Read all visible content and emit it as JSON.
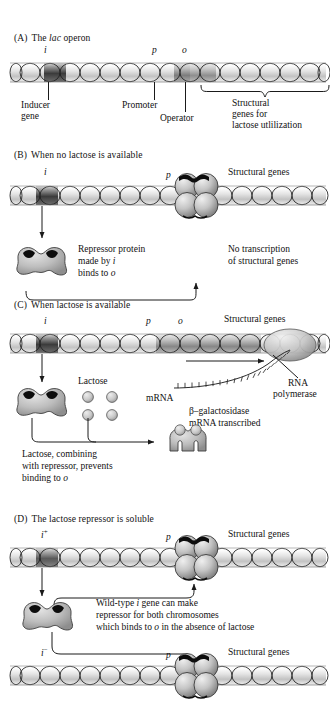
{
  "figure": {
    "background": "#ffffff",
    "ink": "#111111",
    "dna_light": "#f2f2f2",
    "dna_mid": "#b8b8b8",
    "dna_dark": "#4a4a4a",
    "protein_fill": "#b9b9b9",
    "notch_fill": "#101010"
  },
  "panels": [
    {
      "id": "A",
      "tag": "(A)",
      "title_plain_1": "The ",
      "title_italic": "lac",
      "title_plain_2": " operon",
      "gene_labels": [
        {
          "name": "i-gene-label",
          "text": "i"
        },
        {
          "name": "promoter-label",
          "text": "p"
        },
        {
          "name": "operator-label",
          "text": "o"
        }
      ],
      "callouts": [
        {
          "name": "inducer-gene-callout",
          "line1": "Inducer",
          "line2": "gene"
        },
        {
          "name": "promoter-callout",
          "line1": "Promoter",
          "line2": ""
        },
        {
          "name": "operator-callout",
          "line1": "Operator",
          "line2": ""
        },
        {
          "name": "structural-genes-callout",
          "line1": "Structural",
          "line2": "genes for",
          "line3": "lactose utlilization"
        }
      ]
    },
    {
      "id": "B",
      "tag": "(B)",
      "title": "When no lactose is available",
      "gene_labels": [
        {
          "name": "i-gene-label",
          "text": "i"
        },
        {
          "name": "promoter-label",
          "text": "p"
        }
      ],
      "structural_genes_label": "Structural genes",
      "repressor_caption": {
        "line1_a": "Repressor protein",
        "line2_a": "made by ",
        "line2_i": "i",
        "line3_a": "binds to ",
        "line3_o": "o"
      },
      "no_transcription": {
        "line1": "No transcription",
        "line2": "of structural genes"
      }
    },
    {
      "id": "C",
      "tag": "(C)",
      "title": "When lactose is available",
      "gene_labels": [
        {
          "name": "i-gene-label",
          "text": "i"
        },
        {
          "name": "promoter-label",
          "text": "p"
        },
        {
          "name": "operator-label",
          "text": "o"
        }
      ],
      "structural_genes_label": "Structural genes",
      "lactose_label": "Lactose",
      "lactose_count": 4,
      "mrna_label": "mRNA",
      "rna_pol": {
        "line1": "RNA",
        "line2": "polymerase"
      },
      "transcript_caption": {
        "line1": "β–galactosidase",
        "line2": "mRNA transcribed"
      },
      "lactose_caption": {
        "line1": "Lactose, combining",
        "line2": "with repressor, prevents",
        "line3_a": "binding to ",
        "line3_o": "o"
      }
    },
    {
      "id": "D",
      "tag": "(D)",
      "title": "The lactose repressor is soluble",
      "top_chromosome": {
        "i_label": "i",
        "i_superscript": "+",
        "promoter_label": "p",
        "structural_genes_label": "Structural genes"
      },
      "bottom_chromosome": {
        "i_label": "i",
        "i_superscript": "−",
        "promoter_label": "p",
        "structural_genes_label": "Structural genes"
      },
      "caption": {
        "line1_a": "Wild-type ",
        "line1_i": "i",
        "line1_b": " gene can make",
        "line2": "repressor for both chromosomes",
        "line3_a": "which binds to ",
        "line3_o": "o",
        "line3_b": " in the absence of lactose"
      }
    }
  ]
}
